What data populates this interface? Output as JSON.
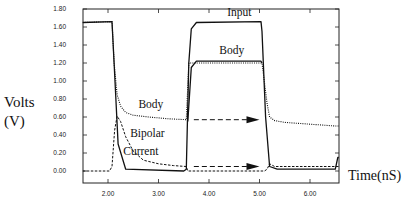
{
  "chart_data": {
    "type": "line",
    "title": "",
    "xlabel": "Time(nS)",
    "ylabel_line1": "Volts",
    "ylabel_line2": "(V)",
    "xlim": [
      1.5,
      6.57
    ],
    "ylim": [
      -0.13,
      1.8
    ],
    "x_ticks": [
      2.0,
      3.0,
      4.0,
      5.0,
      6.0
    ],
    "x_tick_labels": [
      "2.00",
      "3.00",
      "4.00",
      "5.00",
      "6.00"
    ],
    "y_ticks": [
      0.0,
      0.2,
      0.4,
      0.6,
      0.8,
      1.0,
      1.2,
      1.4,
      1.6,
      1.8
    ],
    "y_tick_labels": [
      "0.00",
      "0.20",
      "0.40",
      "0.60",
      "0.80",
      "1.00",
      "1.20",
      "1.40",
      "1.60",
      "1.80"
    ],
    "grid": false,
    "legend": "none (inline annotations)",
    "series": [
      {
        "name": "Input",
        "style": "solid",
        "x": [
          1.5,
          2.08,
          2.12,
          2.2,
          2.35,
          3.5,
          3.55,
          3.6,
          3.65,
          3.75,
          5.03,
          5.05,
          5.12,
          5.2,
          5.35,
          6.5,
          6.55,
          6.57
        ],
        "y": [
          1.65,
          1.66,
          1.2,
          0.3,
          0.02,
          0.0,
          0.02,
          1.2,
          1.58,
          1.65,
          1.66,
          1.55,
          0.6,
          0.05,
          0.02,
          0.02,
          0.15,
          0.15
        ]
      },
      {
        "name": "Body",
        "style": "solid",
        "x": [
          3.58,
          3.65,
          3.75,
          5.03,
          5.05
        ],
        "y": [
          0.55,
          1.15,
          1.22,
          1.22,
          1.2
        ]
      },
      {
        "name": "Body",
        "style": "dotted",
        "x": [
          1.5,
          2.08,
          2.12,
          2.18,
          2.25,
          2.35,
          2.5,
          2.8,
          3.2,
          3.55,
          3.6,
          5.05,
          5.15,
          5.2,
          5.3,
          5.5,
          6.0,
          6.5,
          6.57
        ],
        "y": [
          1.65,
          1.66,
          1.2,
          0.85,
          0.72,
          0.65,
          0.62,
          0.6,
          0.58,
          0.57,
          1.2,
          1.2,
          0.75,
          0.6,
          0.56,
          0.54,
          0.52,
          0.5,
          0.5
        ]
      },
      {
        "name": "Bipolar Current",
        "style": "dashed",
        "x": [
          1.5,
          2.03,
          2.08,
          2.13,
          2.18,
          2.25,
          2.35,
          2.5,
          2.7,
          3.0,
          3.3,
          3.55,
          3.58,
          5.1,
          5.15,
          5.2,
          5.3,
          6.0,
          6.57
        ],
        "y": [
          0.0,
          0.0,
          0.05,
          0.45,
          0.61,
          0.55,
          0.38,
          0.22,
          0.12,
          0.08,
          0.06,
          0.05,
          0.0,
          0.0,
          0.02,
          0.08,
          0.05,
          0.05,
          0.05
        ]
      }
    ],
    "annotations": [
      {
        "text": "Input",
        "x": 4.6,
        "y": 1.72
      },
      {
        "text": "Body",
        "x": 4.45,
        "y": 1.3
      },
      {
        "text": "Body",
        "x": 2.85,
        "y": 0.7
      },
      {
        "text": "Bipolar",
        "x": 2.78,
        "y": 0.38
      },
      {
        "text": "Current",
        "x": 2.65,
        "y": 0.18
      }
    ],
    "arrows": [
      {
        "from": [
          3.7,
          0.57
        ],
        "to": [
          5.0,
          0.57
        ],
        "style": "dashed"
      },
      {
        "from": [
          3.7,
          0.05
        ],
        "to": [
          5.0,
          0.05
        ],
        "style": "dashed"
      }
    ]
  }
}
